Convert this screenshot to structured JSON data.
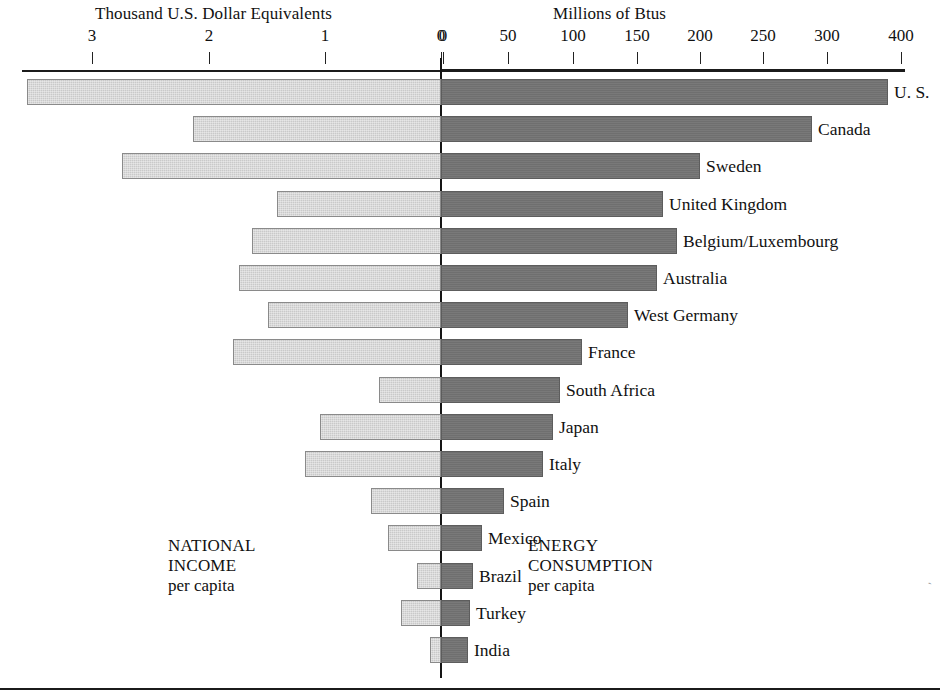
{
  "chart_data": {
    "type": "bar",
    "orientation": "horizontal",
    "style": "bidirectional-pyramid",
    "title": "",
    "left_axis": {
      "label": "Thousand U.S. Dollar Equivalents",
      "ticks": [
        3,
        2,
        1,
        0
      ],
      "tick_labels": [
        "3",
        "2",
        "1",
        "0"
      ],
      "tick_x": [
        92,
        209,
        325,
        441
      ],
      "range": [
        3.6,
        0
      ],
      "direction": "right-to-left",
      "units": "thousand U.S. dollar equivalents"
    },
    "right_axis": {
      "label": "Millions of Btus",
      "ticks": [
        0,
        50,
        100,
        150,
        200,
        250,
        300,
        400
      ],
      "tick_labels": [
        "0",
        "50",
        "100",
        "150",
        "200",
        "250",
        "300",
        "400"
      ],
      "tick_x": [
        443,
        508,
        573,
        637,
        700,
        763,
        827,
        901
      ],
      "range": [
        0,
        400
      ],
      "direction": "left-to-right",
      "units": "millions of Btus",
      "note": "spacing is even in pixels although the last interval spans 100 units"
    },
    "series": [
      {
        "name": "NATIONAL INCOME per capita",
        "side": "left",
        "units": "Thousand U.S. Dollar Equivalents"
      },
      {
        "name": "ENERGY CONSUMPTION per capita",
        "side": "right",
        "units": "Millions of Btus"
      }
    ],
    "categories": [
      "U. S.",
      "Canada",
      "Sweden",
      "United Kingdom",
      "Belgium/Luxembourg",
      "Australia",
      "West Germany",
      "France",
      "South Africa",
      "Japan",
      "Italy",
      "Spain",
      "Mexico",
      "Brazil",
      "Turkey",
      "India"
    ],
    "national_income": [
      3.57,
      2.14,
      2.75,
      1.41,
      1.63,
      1.74,
      1.49,
      1.79,
      0.53,
      1.04,
      1.17,
      0.6,
      0.45,
      0.21,
      0.34,
      0.09
    ],
    "energy_consumption": [
      347,
      285,
      198,
      169,
      180,
      165,
      142,
      107,
      90,
      85,
      78,
      47,
      30,
      24,
      22,
      19
    ],
    "rows": [
      {
        "label": "U. S.",
        "income": 3.57,
        "energy": 347,
        "left_px": 27,
        "right_px": 888
      },
      {
        "label": "Canada",
        "income": 2.14,
        "energy": 285,
        "left_px": 193,
        "right_px": 812
      },
      {
        "label": "Sweden",
        "income": 2.75,
        "energy": 198,
        "left_px": 122,
        "right_px": 700
      },
      {
        "label": "United Kingdom",
        "income": 1.41,
        "energy": 169,
        "left_px": 277,
        "right_px": 663
      },
      {
        "label": "Belgium/Luxembourg",
        "income": 1.63,
        "energy": 180,
        "left_px": 252,
        "right_px": 677
      },
      {
        "label": "Australia",
        "income": 1.74,
        "energy": 165,
        "left_px": 239,
        "right_px": 657
      },
      {
        "label": "West Germany",
        "income": 1.49,
        "energy": 142,
        "left_px": 268,
        "right_px": 628
      },
      {
        "label": "France",
        "income": 1.79,
        "energy": 107,
        "left_px": 233,
        "right_px": 582
      },
      {
        "label": "South Africa",
        "income": 0.53,
        "energy": 90,
        "left_px": 379,
        "right_px": 560
      },
      {
        "label": "Japan",
        "income": 1.04,
        "energy": 85,
        "left_px": 320,
        "right_px": 553
      },
      {
        "label": "Italy",
        "income": 1.17,
        "energy": 78,
        "left_px": 305,
        "right_px": 543
      },
      {
        "label": "Spain",
        "income": 0.6,
        "energy": 47,
        "left_px": 371,
        "right_px": 504
      },
      {
        "label": "Mexico",
        "income": 0.45,
        "energy": 30,
        "left_px": 388,
        "right_px": 482
      },
      {
        "label": "Brazil",
        "income": 0.21,
        "energy": 24,
        "left_px": 417,
        "right_px": 473
      },
      {
        "label": "Turkey",
        "income": 0.34,
        "energy": 22,
        "left_px": 401,
        "right_px": 470
      },
      {
        "label": "India",
        "income": 0.09,
        "energy": 19,
        "left_px": 430,
        "right_px": 468
      }
    ],
    "grid": false,
    "legend_position": "inline-captions"
  },
  "captions": {
    "left": {
      "line1": "NATIONAL",
      "line2": "INCOME",
      "line3": "per capita"
    },
    "right": {
      "line1": "ENERGY",
      "line2": "CONSUMPTION",
      "line3": "per capita"
    }
  },
  "colors": {
    "left_bar_fill": "#c9c9c9",
    "left_bar_border": "#8a8a8a",
    "right_bar_fill": "#6f6f6f",
    "right_bar_border": "#5d5d5d",
    "axis": "#1b1b1b",
    "text": "#111111",
    "background": "#ffffff"
  }
}
